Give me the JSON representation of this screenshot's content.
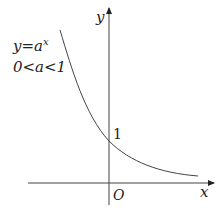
{
  "diagram": {
    "axes": {
      "x_label": "x",
      "y_label": "y",
      "origin_label": "O"
    },
    "annotation": {
      "equation_y": "y=a",
      "equation_exp": "x",
      "condition": "0<a<1"
    },
    "intercept_label": "1",
    "colors": {
      "stroke": "#333333",
      "text": "#222222"
    }
  }
}
